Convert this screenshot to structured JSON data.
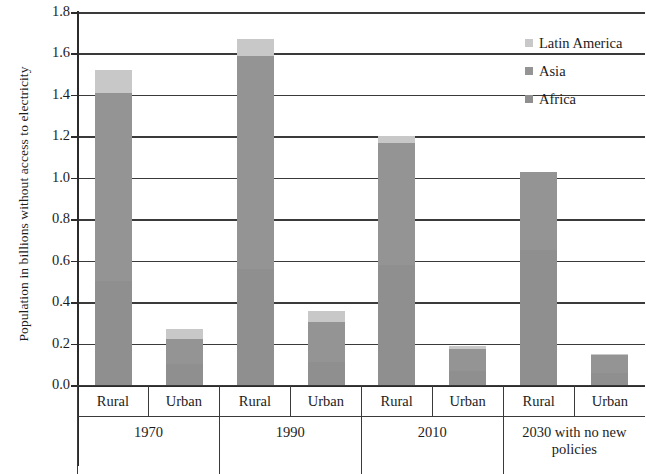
{
  "chart_data": {
    "type": "bar",
    "title": "",
    "subtitle": "",
    "xlabel": "",
    "ylabel": "Population in billions without access to electricity",
    "ylim": [
      0.0,
      1.8
    ],
    "ytick_labels": [
      "1.8",
      "1.6",
      "1.4",
      "1.2",
      "1.0",
      "0.8",
      "0.6",
      "0.4",
      "0.2",
      "0.0"
    ],
    "ytick_values": [
      1.8,
      1.6,
      1.4,
      1.2,
      1.0,
      0.8,
      0.6,
      0.4,
      0.2,
      0.0
    ],
    "grid": true,
    "stacked": true,
    "legend_position": "top-right",
    "legend": [
      "Latin America",
      "Asia",
      "Africa"
    ],
    "periods": [
      "1970",
      "1990",
      "2010",
      "2030 with no new policies"
    ],
    "subcategories": [
      "Rural",
      "Urban"
    ],
    "categories": [
      "1970 Rural",
      "1970 Urban",
      "1990 Rural",
      "1990 Urban",
      "2010 Rural",
      "2010 Urban",
      "2030 Rural",
      "2030 Urban"
    ],
    "series": [
      {
        "name": "Africa",
        "color": "#8f8f8f",
        "values": [
          0.5,
          0.1,
          0.56,
          0.11,
          0.58,
          0.07,
          0.65,
          0.06
        ]
      },
      {
        "name": "Asia",
        "color": "#949494",
        "values": [
          0.91,
          0.12,
          1.03,
          0.195,
          0.59,
          0.105,
          0.38,
          0.085
        ]
      },
      {
        "name": "Latin America",
        "color": "#c8c8c8",
        "values": [
          0.11,
          0.05,
          0.08,
          0.05,
          0.03,
          0.015,
          0.0,
          0.005
        ]
      }
    ],
    "totals": [
      1.52,
      0.27,
      1.67,
      0.355,
      1.2,
      0.19,
      1.03,
      0.15
    ]
  },
  "legend": {
    "items": [
      {
        "label": "Latin America",
        "color": "#c8c8c8"
      },
      {
        "label": "Asia",
        "color": "#949494"
      },
      {
        "label": "Africa",
        "color": "#8f8f8f"
      }
    ]
  },
  "axis": {
    "y_title": "Population in billions without access to electricity",
    "y_ticks": [
      "1.8",
      "1.6",
      "1.4",
      "1.2",
      "1.0",
      "0.8",
      "0.6",
      "0.4",
      "0.2",
      "0.0"
    ]
  },
  "xaxis": {
    "subcategories": [
      "Rural",
      "Urban",
      "Rural",
      "Urban",
      "Rural",
      "Urban",
      "Rural",
      "Urban"
    ],
    "periods": [
      "1970",
      "1990",
      "2010",
      "2030 with no new policies"
    ]
  }
}
